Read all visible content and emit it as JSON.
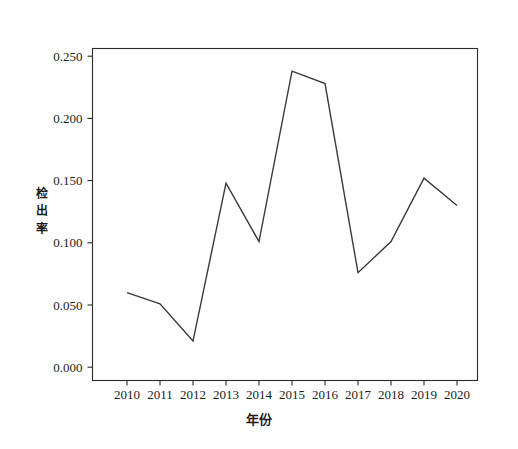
{
  "chart_data": {
    "type": "line",
    "title": "",
    "subtitle": "",
    "xlabel": "年份",
    "ylabel": "检出率",
    "x": [
      2010,
      2011,
      2012,
      2013,
      2014,
      2015,
      2016,
      2017,
      2018,
      2019,
      2020
    ],
    "categories": [
      "2010",
      "2011",
      "2012",
      "2013",
      "2014",
      "2015",
      "2016",
      "2017",
      "2018",
      "2019",
      "2020"
    ],
    "values": [
      0.06,
      0.051,
      0.021,
      0.148,
      0.101,
      0.238,
      0.228,
      0.076,
      0.101,
      0.152,
      0.13
    ],
    "series": [
      {
        "name": "检出率",
        "values": [
          0.06,
          0.051,
          0.021,
          0.148,
          0.101,
          0.238,
          0.228,
          0.076,
          0.101,
          0.152,
          0.13
        ]
      }
    ],
    "ylim": [
      0.0,
      0.26
    ],
    "xlim": [
      2009.5,
      2020.6
    ],
    "ytick_labels": [
      "0.000",
      "0.050",
      "0.100",
      "0.150",
      "0.200",
      "0.250"
    ],
    "ytick_values": [
      0.0,
      0.05,
      0.1,
      0.15,
      0.2,
      0.25
    ],
    "xtick_labels": [
      "2010",
      "2011",
      "2012",
      "2013",
      "2014",
      "2015",
      "2016",
      "2017",
      "2018",
      "2019",
      "2020"
    ],
    "grid": false,
    "legend": "none",
    "line_color": "#3a3a3a",
    "axis_color": "#2a2a2a",
    "background_color": "#ffffff"
  },
  "axis": {
    "y_title_chars": [
      "检",
      "出",
      "率"
    ],
    "y_title": "检出率",
    "x_title": "年份"
  },
  "ticks": {
    "y": [
      {
        "label": "0.250",
        "value": 0.25
      },
      {
        "label": "0.200",
        "value": 0.2
      },
      {
        "label": "0.150",
        "value": 0.15
      },
      {
        "label": "0.100",
        "value": 0.1
      },
      {
        "label": "0.050",
        "value": 0.05
      },
      {
        "label": "0.000",
        "value": 0.0
      }
    ],
    "x": [
      {
        "label": "2010",
        "value": 2010
      },
      {
        "label": "2011",
        "value": 2011
      },
      {
        "label": "2012",
        "value": 2012
      },
      {
        "label": "2013",
        "value": 2013
      },
      {
        "label": "2014",
        "value": 2014
      },
      {
        "label": "2015",
        "value": 2015
      },
      {
        "label": "2016",
        "value": 2016
      },
      {
        "label": "2017",
        "value": 2017
      },
      {
        "label": "2018",
        "value": 2018
      },
      {
        "label": "2019",
        "value": 2019
      },
      {
        "label": "2020",
        "value": 2020
      }
    ]
  }
}
